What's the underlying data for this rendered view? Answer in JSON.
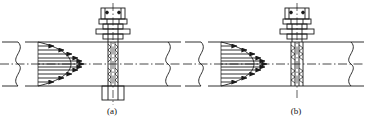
{
  "figure": {
    "title": "",
    "background": "#ffffff",
    "line_color": "#1a1a1a",
    "width": 366,
    "height": 122
  },
  "panels": [
    {
      "id": "panel-a",
      "caption": "(a)",
      "caption_x": 112,
      "caption_y": 112,
      "origin_x": 0,
      "pipe": {
        "top_wall_y": 42,
        "bottom_wall_y": 86,
        "centerline_y": 64,
        "left_break_x": 18,
        "right_break_x": 168,
        "left_end_x": 2,
        "right_end_x": 181
      },
      "probe": {
        "type": "single-rod-insertion-probe",
        "axis_x": 113,
        "through_wall": true,
        "extends_below_pipe": true,
        "lower_chamber": true
      },
      "velocity_profile": {
        "label": "parabolic velocity profile",
        "arrow_count": 11,
        "tail_x": 38,
        "max_tip_x": 88,
        "arrow_ys": [
          46,
          50,
          54,
          58,
          61,
          64,
          67,
          70,
          74,
          78,
          82
        ],
        "arrow_lengths": [
          18,
          29,
          37,
          43,
          47,
          50,
          47,
          43,
          37,
          29,
          18
        ]
      }
    },
    {
      "id": "panel-b",
      "caption": "(b)",
      "caption_x": 296,
      "caption_y": 112,
      "origin_x": 183,
      "pipe": {
        "top_wall_y": 42,
        "bottom_wall_y": 86,
        "centerline_y": 64,
        "left_break_x": 201,
        "right_break_x": 351,
        "left_end_x": 185,
        "right_end_x": 364
      },
      "probe": {
        "type": "dual-rod-averaging-probe",
        "axis_x": 297,
        "through_wall": true,
        "extends_below_pipe": false,
        "lower_chamber": false
      },
      "velocity_profile": {
        "label": "parabolic velocity profile",
        "arrow_count": 11,
        "tail_x": 222,
        "max_tip_x": 272,
        "arrow_ys": [
          46,
          50,
          54,
          58,
          61,
          64,
          67,
          70,
          74,
          78,
          82
        ],
        "arrow_lengths": [
          18,
          29,
          37,
          43,
          47,
          50,
          47,
          43,
          37,
          29,
          18
        ]
      }
    }
  ],
  "legend": {
    "centerline_style": "dash-dot",
    "hatch_style": "zigzag-thread",
    "line_weight": "0.9px"
  }
}
